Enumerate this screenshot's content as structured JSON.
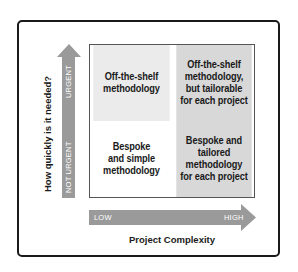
{
  "diagram": {
    "type": "2x2 matrix",
    "y_axis": {
      "title": "How quickly is it needed?",
      "low_label": "NOT URGENT",
      "high_label": "URGENT"
    },
    "x_axis": {
      "title": "Project Complexity",
      "low_label": "LOW",
      "high_label": "HIGH"
    },
    "quadrants": {
      "top_left": {
        "lines": [
          "Off-the-shelf",
          "methodology"
        ]
      },
      "top_right": {
        "lines": [
          "Off-the-shelf",
          "methodology,",
          "but tailorable",
          "for each project"
        ]
      },
      "bottom_left": {
        "lines": [
          "Bespoke",
          "and simple",
          "methodology"
        ]
      },
      "bottom_right": {
        "lines": [
          "Bespoke and",
          "tailored",
          "methodology",
          "for each project"
        ]
      }
    },
    "colors": {
      "arrow": "#9a9a9a",
      "quadrant_light": "#ebebeb",
      "quadrant_dark": "#d8d8d8",
      "quadrant_white": "#ffffff",
      "frame": "#1a1a1a",
      "text": "#1a1a1a"
    }
  }
}
